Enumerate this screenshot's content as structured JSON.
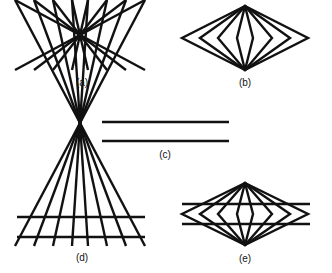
{
  "diagram": {
    "stroke_color": "#111111",
    "background": "#ffffff",
    "panels": [
      {
        "id": "a",
        "label": "(a)",
        "content": "radiating lines crossing at a central point (8 lines)"
      },
      {
        "id": "b",
        "label": "(b)",
        "content": "nested diamonds sharing top and bottom apex (4 diamonds)"
      },
      {
        "id": "c",
        "label": "(c)",
        "content": "two parallel horizontal lines"
      },
      {
        "id": "d",
        "label": "(d)",
        "content": "parallel lines superimposed on radiating lines"
      },
      {
        "id": "e",
        "label": "(e)",
        "content": "parallel lines superimposed on nested diamonds"
      }
    ]
  }
}
